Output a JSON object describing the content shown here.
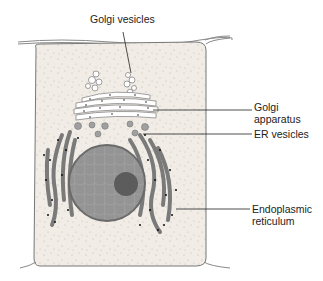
{
  "diagram": {
    "labels": {
      "golgi_vesicles": "Golgi vesicles",
      "golgi_apparatus_line1": "Golgi",
      "golgi_apparatus_line2": "apparatus",
      "er_vesicles": "ER vesicles",
      "endoplasmic_reticulum_line1": "Endoplasmic",
      "endoplasmic_reticulum_line2": "reticulum"
    },
    "colors": {
      "cytoplasm": "#efeae2",
      "nucleus": "#8f8f8f",
      "nucleolus": "#5a5a5a",
      "er": "#7a7a7a",
      "ribosome": "#111111",
      "outline": "#666666"
    }
  }
}
